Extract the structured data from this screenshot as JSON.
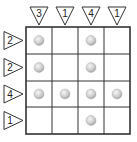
{
  "puzzle": {
    "rows": 4,
    "cols": 4,
    "column_clues": [
      "3",
      "1",
      "4",
      "1"
    ],
    "row_clues": [
      "2",
      "2",
      "4",
      "1"
    ],
    "balls": [
      [
        true,
        false,
        true,
        false
      ],
      [
        true,
        false,
        true,
        false
      ],
      [
        true,
        true,
        true,
        true
      ],
      [
        false,
        false,
        true,
        false
      ]
    ]
  },
  "colors": {
    "grid_line": "#333333",
    "ball_light": "#f4f4f4",
    "ball_dark": "#a9a9a9",
    "clue_stroke": "#333333"
  }
}
